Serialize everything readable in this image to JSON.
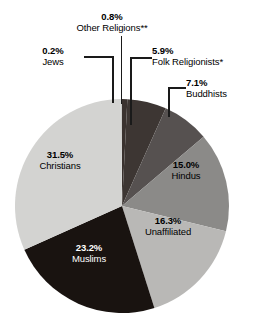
{
  "chart_data": {
    "type": "pie",
    "title": "",
    "subtitle": "",
    "xlabel": "",
    "ylabel": "",
    "legend_position": "none",
    "grid": false,
    "units": "percent",
    "start_angle_deg": 0,
    "direction": "clockwise",
    "categories": [
      "Other Religions**",
      "Folk Religionists*",
      "Buddhists",
      "Hindus",
      "Unaffiliated",
      "Muslims",
      "Christians",
      "Jews"
    ],
    "values": [
      0.8,
      5.9,
      7.1,
      15.0,
      16.3,
      23.2,
      31.5,
      0.2
    ],
    "slices": [
      {
        "name": "Other Religions**",
        "value": 0.8,
        "pct_label": "0.8%",
        "color": "#3a322f",
        "label_placement": "callout",
        "label_text_color": "#000000"
      },
      {
        "name": "Folk Religionists*",
        "value": 5.9,
        "pct_label": "5.9%",
        "color": "#3d3633",
        "label_placement": "callout",
        "label_text_color": "#000000"
      },
      {
        "name": "Buddhists",
        "value": 7.1,
        "pct_label": "7.1%",
        "color": "#565150",
        "label_placement": "callout",
        "label_text_color": "#000000"
      },
      {
        "name": "Hindus",
        "value": 15.0,
        "pct_label": "15.0%",
        "color": "#8b8a88",
        "label_placement": "inside",
        "label_text_color": "#000000"
      },
      {
        "name": "Unaffiliated",
        "value": 16.3,
        "pct_label": "16.3%",
        "color": "#b9b8b6",
        "label_placement": "inside",
        "label_text_color": "#000000"
      },
      {
        "name": "Muslims",
        "value": 23.2,
        "pct_label": "23.2%",
        "color": "#191310",
        "label_placement": "inside",
        "label_text_color": "#ffffff"
      },
      {
        "name": "Christians",
        "value": 31.5,
        "pct_label": "31.5%",
        "color": "#d3d3d1",
        "label_placement": "inside",
        "label_text_color": "#000000"
      },
      {
        "name": "Jews",
        "value": 0.2,
        "pct_label": "0.2%",
        "color": "#c9c9c7",
        "label_placement": "callout",
        "label_text_color": "#000000"
      }
    ]
  },
  "callouts": {
    "other_religions": {
      "pct": "0.8%",
      "name": "Other Religions**"
    },
    "jews": {
      "pct": "0.2%",
      "name": "Jews"
    },
    "folk": {
      "pct": "5.9%",
      "name": "Folk Religionists*"
    },
    "buddhists": {
      "pct": "7.1%",
      "name": "Buddhists"
    }
  },
  "inside_labels": {
    "hindus": {
      "pct": "15.0%",
      "name": "Hindus"
    },
    "unaffiliated": {
      "pct": "16.3%",
      "name": "Unaffiliated"
    },
    "muslims": {
      "pct": "23.2%",
      "name": "Muslims"
    },
    "christians": {
      "pct": "31.5%",
      "name": "Christians"
    }
  },
  "colors": {
    "background": "#ffffff",
    "leader_line": "#1a1a1a",
    "text_dark": "#000000",
    "text_light": "#ffffff"
  }
}
